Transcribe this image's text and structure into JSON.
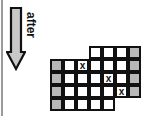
{
  "caption": "after",
  "arrow": {
    "direction": "down",
    "fill": "#c8c8c8",
    "stroke": "#111111"
  },
  "grid": {
    "cell_size": 13,
    "cells": [
      {
        "r": 0,
        "c": 3,
        "type": "white",
        "mark": ""
      },
      {
        "r": 0,
        "c": 4,
        "type": "white",
        "mark": ""
      },
      {
        "r": 0,
        "c": 5,
        "type": "white",
        "mark": ""
      },
      {
        "r": 0,
        "c": 6,
        "type": "gray",
        "mark": ""
      },
      {
        "r": 1,
        "c": 0,
        "type": "gray",
        "mark": ""
      },
      {
        "r": 1,
        "c": 1,
        "type": "white",
        "mark": ""
      },
      {
        "r": 1,
        "c": 2,
        "type": "white",
        "mark": "x"
      },
      {
        "r": 1,
        "c": 3,
        "type": "white",
        "mark": ""
      },
      {
        "r": 1,
        "c": 4,
        "type": "white",
        "mark": ""
      },
      {
        "r": 1,
        "c": 5,
        "type": "white",
        "mark": ""
      },
      {
        "r": 1,
        "c": 6,
        "type": "gray",
        "mark": ""
      },
      {
        "r": 2,
        "c": 0,
        "type": "gray",
        "mark": ""
      },
      {
        "r": 2,
        "c": 1,
        "type": "white",
        "mark": ""
      },
      {
        "r": 2,
        "c": 2,
        "type": "white",
        "mark": ""
      },
      {
        "r": 2,
        "c": 3,
        "type": "white",
        "mark": ""
      },
      {
        "r": 2,
        "c": 4,
        "type": "white",
        "mark": "x"
      },
      {
        "r": 2,
        "c": 5,
        "type": "white",
        "mark": ""
      },
      {
        "r": 2,
        "c": 6,
        "type": "gray",
        "mark": ""
      },
      {
        "r": 3,
        "c": 0,
        "type": "gray",
        "mark": ""
      },
      {
        "r": 3,
        "c": 1,
        "type": "white",
        "mark": ""
      },
      {
        "r": 3,
        "c": 2,
        "type": "white",
        "mark": ""
      },
      {
        "r": 3,
        "c": 3,
        "type": "white",
        "mark": ""
      },
      {
        "r": 3,
        "c": 4,
        "type": "white",
        "mark": ""
      },
      {
        "r": 3,
        "c": 5,
        "type": "white",
        "mark": "x"
      },
      {
        "r": 3,
        "c": 6,
        "type": "gray",
        "mark": ""
      },
      {
        "r": 4,
        "c": 0,
        "type": "gray",
        "mark": ""
      },
      {
        "r": 4,
        "c": 1,
        "type": "white",
        "mark": ""
      },
      {
        "r": 4,
        "c": 2,
        "type": "white",
        "mark": ""
      },
      {
        "r": 4,
        "c": 3,
        "type": "white",
        "mark": ""
      },
      {
        "r": 4,
        "c": 4,
        "type": "white",
        "mark": ""
      }
    ]
  }
}
